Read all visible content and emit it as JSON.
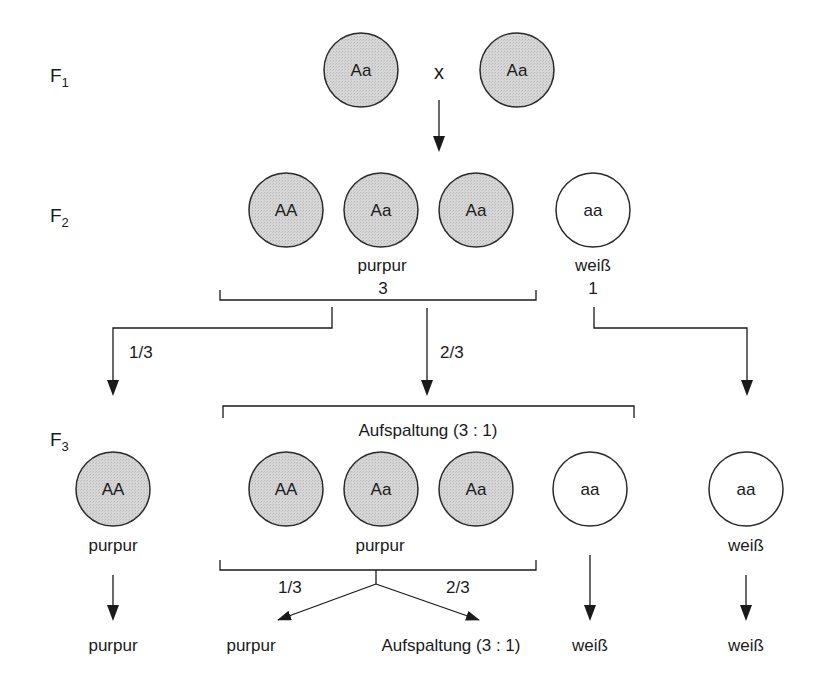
{
  "colors": {
    "purple_fill": "#d4d4d4",
    "white_fill": "#ffffff",
    "stroke": "#2a2a2a"
  },
  "generations": {
    "f1": {
      "letter": "F",
      "index": "1"
    },
    "f2": {
      "letter": "F",
      "index": "2"
    },
    "f3": {
      "letter": "F",
      "index": "3"
    }
  },
  "f1": {
    "parent_left": "Aa",
    "cross_symbol": "x",
    "parent_right": "Aa"
  },
  "f2": {
    "genotypes": [
      "AA",
      "Aa",
      "Aa",
      "aa"
    ],
    "phenotype_purple": "purpur",
    "phenotype_white": "weiß",
    "ratio_purple": "3",
    "ratio_white": "1",
    "branch_left_fraction": "1/3",
    "branch_middle_fraction": "2/3"
  },
  "f3": {
    "segregation_label": "Aufspaltung (3 : 1)",
    "left_genotype": "AA",
    "left_phenotype": "purpur",
    "middle_genotypes": [
      "AA",
      "Aa",
      "Aa",
      "aa"
    ],
    "middle_phenotype": "purpur",
    "right_genotype": "aa",
    "right_phenotype": "weiß",
    "split_left_fraction": "1/3",
    "split_right_fraction": "2/3"
  },
  "outcomes": {
    "left": "purpur",
    "middle_left": "purpur",
    "middle_right": "Aufspaltung (3 : 1)",
    "middle_white": "weiß",
    "right": "weiß"
  }
}
